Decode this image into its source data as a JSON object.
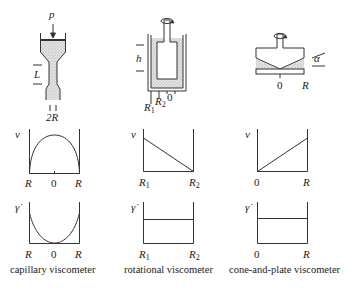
{
  "panels": [
    {
      "id": "capillary",
      "caption": "capillary viscometer",
      "device_labels": {
        "pressure": "p",
        "length": "L",
        "diameter": "2R"
      },
      "velocity_plot": {
        "ylabel": "v",
        "x_left": "R",
        "x_mid": "0",
        "x_right": "R",
        "profile": "parabolic"
      },
      "shear_plot": {
        "ylabel": "γ̇",
        "x_left": "R",
        "x_mid": "0",
        "x_right": "R",
        "profile": "V-shaped/parabolic (zero at center)"
      }
    },
    {
      "id": "rotational",
      "caption": "rotational viscometer",
      "device_labels": {
        "height": "h",
        "r1": "R",
        "r1_sub": "1",
        "r2": "R",
        "r2_sub": "2",
        "center": "0"
      },
      "velocity_plot": {
        "ylabel": "v",
        "x_left": "R",
        "x_left_sub": "1",
        "x_right": "R",
        "x_right_sub": "2",
        "profile": "linear decreasing"
      },
      "shear_plot": {
        "ylabel": "γ̇",
        "x_left": "R",
        "x_left_sub": "1",
        "x_right": "R",
        "x_right_sub": "2",
        "profile": "constant"
      }
    },
    {
      "id": "cone-and-plate",
      "caption": "cone-and-plate viscometer",
      "device_labels": {
        "angle": "α",
        "center": "0",
        "radius": "R"
      },
      "velocity_plot": {
        "ylabel": "v",
        "x_left": "0",
        "x_right": "R",
        "profile": "linear increasing"
      },
      "shear_plot": {
        "ylabel": "γ̇",
        "x_left": "0",
        "x_right": "R",
        "profile": "constant"
      }
    }
  ]
}
